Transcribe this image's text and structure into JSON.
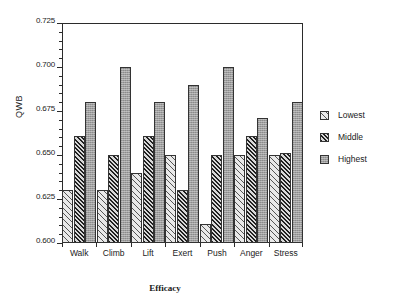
{
  "chart_data": {
    "type": "bar",
    "title": "",
    "xlabel": "Efficacy",
    "ylabel": "QWB",
    "categories": [
      "Walk",
      "Climb",
      "Lift",
      "Exert",
      "Push",
      "Anger",
      "Stress"
    ],
    "series": [
      {
        "name": "Lowest",
        "values": [
          0.63,
          0.63,
          0.64,
          0.65,
          0.611,
          0.65,
          0.65
        ]
      },
      {
        "name": "Middle",
        "values": [
          0.661,
          0.65,
          0.661,
          0.63,
          0.65,
          0.661,
          0.651
        ]
      },
      {
        "name": "Highest",
        "values": [
          0.68,
          0.7,
          0.68,
          0.69,
          0.7,
          0.671,
          0.68
        ]
      }
    ],
    "ylim": [
      0.6,
      0.725
    ],
    "ytick_labels": [
      "0.600",
      "0.625",
      "0.650",
      "0.675",
      "0.700",
      "0.725"
    ],
    "ytick_values": [
      0.6,
      0.625,
      0.65,
      0.675,
      0.7,
      0.725
    ],
    "grid": false,
    "legend_position": "right",
    "legend_entries": [
      "Lowest",
      "Middle",
      "Highest"
    ],
    "colors": {
      "lowest": "#e9e9e9",
      "middle": "#9a9a9a",
      "highest": "#9e9e9e",
      "axis": "#2b2b2b",
      "background": "#ffffff"
    }
  }
}
